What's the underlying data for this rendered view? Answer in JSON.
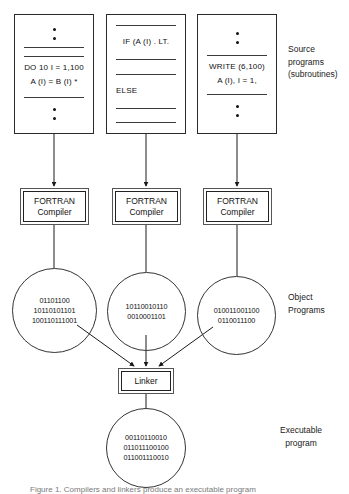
{
  "figure": {
    "caption": "Figure 1. Compilers and linkers produce an executable program"
  },
  "source_programs": {
    "label_line1": "Source",
    "label_line2": "programs",
    "label_line3": "(subroutines)",
    "boxes": [
      {
        "name": "source-box-1",
        "rows": [
          {
            "kind": "dot"
          },
          {
            "kind": "dot"
          },
          {
            "kind": "rule"
          },
          {
            "kind": "rule"
          },
          {
            "kind": "code",
            "text": "DO  10  I  =  1,100"
          },
          {
            "kind": "code",
            "text": "A (I)  =  B (I) *"
          },
          {
            "kind": "rule"
          },
          {
            "kind": "dot"
          },
          {
            "kind": "dot"
          }
        ]
      },
      {
        "name": "source-box-2",
        "rows": [
          {
            "kind": "rule"
          },
          {
            "kind": "code",
            "text": "IF  (A (I) . LT."
          },
          {
            "kind": "rule"
          },
          {
            "kind": "rule"
          },
          {
            "kind": "code",
            "text": "ELSE"
          },
          {
            "kind": "rule"
          },
          {
            "kind": "rule"
          }
        ]
      },
      {
        "name": "source-box-3",
        "rows": [
          {
            "kind": "dot"
          },
          {
            "kind": "dot"
          },
          {
            "kind": "rule"
          },
          {
            "kind": "code",
            "text": "WRITE (6,100)"
          },
          {
            "kind": "code",
            "text": "A (I), I  =  1,"
          },
          {
            "kind": "rule"
          },
          {
            "kind": "dot"
          },
          {
            "kind": "dot"
          }
        ]
      }
    ]
  },
  "compilers": [
    {
      "line1": "FORTRAN",
      "line2": "Compiler"
    },
    {
      "line1": "FORTRAN",
      "line2": "Compiler"
    },
    {
      "line1": "FORTRAN",
      "line2": "Compiler"
    }
  ],
  "object_programs": {
    "label_line1": "Object",
    "label_line2": "Programs",
    "circles": [
      {
        "lines": [
          "01101100",
          "10110101101",
          "100110111001"
        ]
      },
      {
        "lines": [
          "10110010110",
          "0010001101"
        ]
      },
      {
        "lines": [
          "010011001100",
          "0110011100"
        ]
      }
    ]
  },
  "linker": {
    "label": "Linker"
  },
  "executable": {
    "label_line1": "Executable",
    "label_line2": "program",
    "circle": {
      "lines": [
        "00110110010",
        "011011100100",
        "011001110010"
      ]
    }
  },
  "colors": {
    "stroke": "#2a2a2a",
    "text": "#111111",
    "caption": "#7a7a7a",
    "background": "#ffffff"
  }
}
